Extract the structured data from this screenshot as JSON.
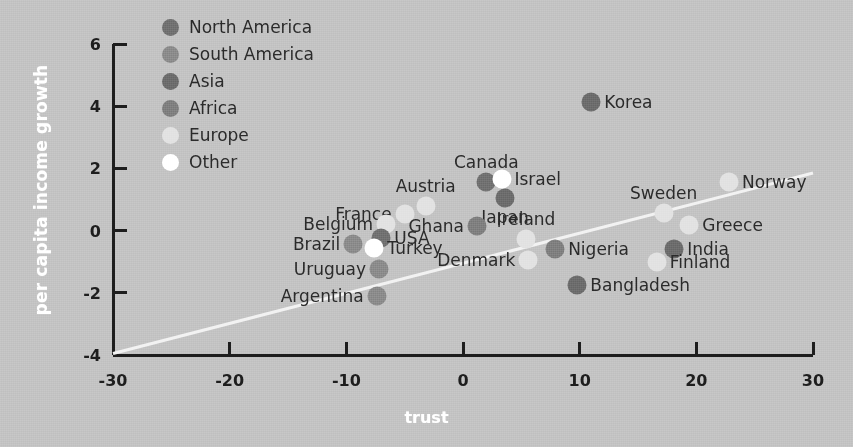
{
  "chart_data": {
    "type": "scatter",
    "title": "",
    "xlabel": "trust",
    "ylabel": "per capita income growth",
    "xlim": [
      -30,
      30
    ],
    "ylim": [
      -4,
      6
    ],
    "xticks": [
      "-30",
      "-20",
      "-10",
      "0",
      "10",
      "20",
      "30"
    ],
    "xtick_values": [
      -30,
      -20,
      -10,
      0,
      10,
      20,
      30
    ],
    "yticks": [
      "6",
      "4",
      "2",
      "0",
      "-2",
      "-4"
    ],
    "ytick_values": [
      6,
      4,
      2,
      0,
      -2,
      -4
    ],
    "grid": false,
    "legend_position": "top-left",
    "legend": [
      {
        "label": "North America",
        "color": "#707070"
      },
      {
        "label": "South America",
        "color": "#8a8a8a"
      },
      {
        "label": "Asia",
        "color": "#6b6b6b"
      },
      {
        "label": "Africa",
        "color": "#7e7e7e"
      },
      {
        "label": "Europe",
        "color": "#e2e2e2"
      },
      {
        "label": "Other",
        "color": "#ffffff"
      }
    ],
    "trendline": {
      "x1": -30,
      "y1": -3.95,
      "x2": 30,
      "y2": 1.85,
      "color": "#f2f2f2"
    },
    "points": [
      {
        "name": "Korea",
        "x": 11.0,
        "y": 4.15,
        "group": "Asia",
        "color": "#6b6b6b",
        "label_side": "right"
      },
      {
        "name": "Canada",
        "x": 2.0,
        "y": 1.55,
        "group": "North America",
        "color": "#707070",
        "label_side": "above"
      },
      {
        "name": "Israel",
        "x": 3.3,
        "y": 1.65,
        "group": "Other",
        "color": "#ffffff",
        "label_side": "right"
      },
      {
        "name": "Japan",
        "x": 3.6,
        "y": 1.05,
        "group": "Asia",
        "color": "#6b6b6b",
        "label_side": "below"
      },
      {
        "name": "Austria",
        "x": -3.2,
        "y": 0.78,
        "group": "Europe",
        "color": "#e2e2e2",
        "label_side": "above"
      },
      {
        "name": "France",
        "x": -5.0,
        "y": 0.52,
        "group": "Europe",
        "color": "#e2e2e2",
        "label_side": "left"
      },
      {
        "name": "Ghana",
        "x": 1.2,
        "y": 0.15,
        "group": "Africa",
        "color": "#7e7e7e",
        "label_side": "left"
      },
      {
        "name": "Norway",
        "x": 22.8,
        "y": 1.55,
        "group": "Europe",
        "color": "#e2e2e2",
        "label_side": "right"
      },
      {
        "name": "Sweden",
        "x": 17.2,
        "y": 0.55,
        "group": "Europe",
        "color": "#e2e2e2",
        "label_side": "above"
      },
      {
        "name": "Greece",
        "x": 19.4,
        "y": 0.18,
        "group": "Europe",
        "color": "#e2e2e2",
        "label_side": "right"
      },
      {
        "name": "Belgium",
        "x": -6.6,
        "y": 0.22,
        "group": "Europe",
        "color": "#e2e2e2",
        "label_side": "left"
      },
      {
        "name": "Brazil",
        "x": -9.4,
        "y": -0.42,
        "group": "South America",
        "color": "#8a8a8a",
        "label_side": "left"
      },
      {
        "name": "USA",
        "x": -7.0,
        "y": -0.25,
        "group": "North America",
        "color": "#707070",
        "label_side": "right"
      },
      {
        "name": "Turkey",
        "x": -7.6,
        "y": -0.55,
        "group": "Other",
        "color": "#ffffff",
        "label_side": "right"
      },
      {
        "name": "Ireland",
        "x": 5.4,
        "y": -0.28,
        "group": "Europe",
        "color": "#e2e2e2",
        "label_side": "above"
      },
      {
        "name": "Nigeria",
        "x": 7.9,
        "y": -0.6,
        "group": "Africa",
        "color": "#7e7e7e",
        "label_side": "right"
      },
      {
        "name": "India",
        "x": 18.1,
        "y": -0.58,
        "group": "Asia",
        "color": "#6b6b6b",
        "label_side": "right"
      },
      {
        "name": "Finland",
        "x": 16.6,
        "y": -1.02,
        "group": "Europe",
        "color": "#e2e2e2",
        "label_side": "right"
      },
      {
        "name": "Denmark",
        "x": 5.6,
        "y": -0.95,
        "group": "Europe",
        "color": "#e2e2e2",
        "label_side": "left"
      },
      {
        "name": "Uruguay",
        "x": -7.2,
        "y": -1.25,
        "group": "South America",
        "color": "#8a8a8a",
        "label_side": "left"
      },
      {
        "name": "Bangladesh",
        "x": 9.8,
        "y": -1.75,
        "group": "Asia",
        "color": "#6b6b6b",
        "label_side": "right"
      },
      {
        "name": "Argentina",
        "x": -7.4,
        "y": -2.1,
        "group": "South America",
        "color": "#8a8a8a",
        "label_side": "left"
      }
    ]
  },
  "axes": {
    "axis_color": "#1d1d1d",
    "background": "#c3c3c3"
  }
}
